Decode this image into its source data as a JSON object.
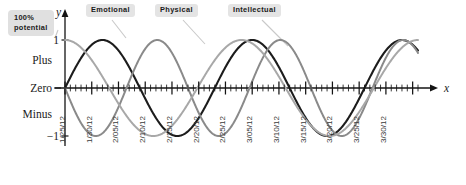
{
  "chart_data": {
    "type": "line",
    "title": "",
    "xlabel": "x",
    "ylabel": "y",
    "ylim": [
      -1,
      1
    ],
    "grid": false,
    "legend_position": "top-inside",
    "y_tick_labels": [
      "1",
      "-1"
    ],
    "y_zone_labels": [
      "Plus",
      "Zero",
      "Minus"
    ],
    "callout": "100%\npotential",
    "x_tick_labels": [
      "1/25/12",
      "1/30/12",
      "2/05/12",
      "2/10/12",
      "2/15/12",
      "2/20/12",
      "2/25/12",
      "3/05/12",
      "3/10/12",
      "3/15/12",
      "3/20/12",
      "3/25/12",
      "3/30/12"
    ],
    "x_minor_tick_interval_days": 1,
    "x_major_tick_interval_days": 5,
    "series": [
      {
        "name": "Emotional",
        "period_days": 28,
        "amplitude": 1,
        "phase_days": 0,
        "color": "#1c1c1c",
        "width": 2.1
      },
      {
        "name": "Physical",
        "period_days": 23,
        "amplitude": 1,
        "phase_days": 11.5,
        "color": "#8a8a8a",
        "width": 2.0
      },
      {
        "name": "Intellectual",
        "period_days": 33,
        "amplitude": 1,
        "phase_days": 8.25,
        "color": "#a8a8a8",
        "width": 2.0
      }
    ]
  },
  "axes": {
    "y_axis_letter": "y",
    "x_axis_letter": "x",
    "top_value": "1",
    "bottom_value": "−1",
    "plus_label": "Plus",
    "zero_label": "Zero",
    "minus_label": "Minus"
  },
  "callout": {
    "line1": "100%",
    "line2": "potential"
  },
  "legend": {
    "items": [
      {
        "label": "Emotional",
        "color": "#1c1c1c"
      },
      {
        "label": "Physical",
        "color": "#8a8a8a"
      },
      {
        "label": "Intellectual",
        "color": "#a8a8a8"
      }
    ]
  }
}
